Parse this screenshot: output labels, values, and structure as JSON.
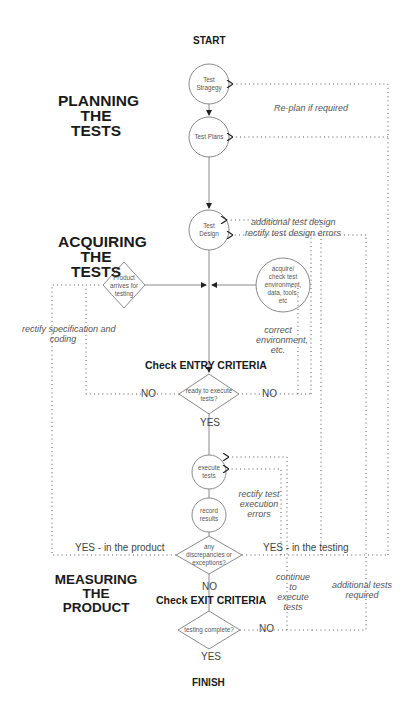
{
  "start_label": "START",
  "finish_label": "FINISH",
  "sections": {
    "planning": [
      "PLANNING",
      "THE TESTS"
    ],
    "acquiring": [
      "ACQUIRING",
      "THE TESTS"
    ],
    "measuring": [
      "MEASURING THE",
      "PRODUCT"
    ]
  },
  "nodes": {
    "test_strategy": [
      "Test",
      "Stragegy"
    ],
    "test_plans": "Test Plans",
    "test_design": [
      "Test",
      "Design"
    ],
    "product_arrives": [
      "Product",
      "arrives for",
      "testing"
    ],
    "acquire_env": [
      "acquire/",
      "check test",
      "environment,",
      "data, tools,",
      "etc"
    ],
    "ready_to_execute": [
      "ready to execute",
      "tests?"
    ],
    "execute_tests": [
      "execute",
      "tests"
    ],
    "record_results": [
      "record",
      "results"
    ],
    "any_discrepancies": [
      "any",
      "discrepancies or",
      "exceptions?"
    ],
    "testing_complete": "testing complete?"
  },
  "criteria": {
    "entry": "Check ENTRY CRITERIA",
    "exit": "Check EXIT CRITERIA"
  },
  "branches": {
    "entry_no_left": "NO",
    "entry_no_right": "NO",
    "entry_yes": "YES",
    "yes_product": "YES - in the product",
    "yes_testing": "YES - in the testing",
    "discrepancy_no": "NO",
    "exit_no": "NO",
    "exit_yes": "YES"
  },
  "notes": {
    "replan": "Re-plan if required",
    "additional_test_design": "additional test design",
    "rectify_test_design": "rectify test design errors",
    "rectify_spec": [
      "rectify specification and",
      "coding"
    ],
    "correct_env": [
      "correct",
      "environment,",
      "etc."
    ],
    "rectify_test_execution": [
      "rectify test",
      "execution",
      "errors"
    ],
    "continue_execute": [
      "continue",
      "to",
      "execute",
      "tests"
    ],
    "additional_tests": [
      "additional tests",
      "required"
    ]
  },
  "colors": {
    "line": "#8a8a8a",
    "dotted": "#666666",
    "text_dark": "#1a1a1a",
    "text_note": "#555555"
  }
}
